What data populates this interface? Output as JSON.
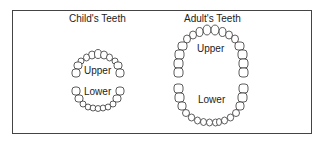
{
  "diagram": {
    "child": {
      "title": "Child's Teeth",
      "upper_label": "Upper",
      "lower_label": "Lower"
    },
    "adult": {
      "title": "Adult's Teeth",
      "upper_label": "Upper",
      "lower_label": "Lower"
    }
  }
}
